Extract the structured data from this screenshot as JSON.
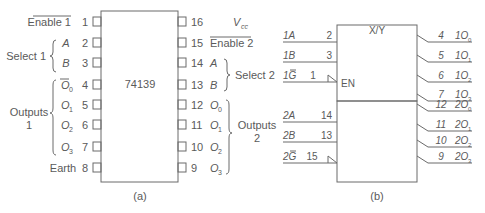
{
  "diagram_a": {
    "chip_label": "74139",
    "caption": "(a)",
    "left_pins": [
      {
        "num": "1",
        "label": "Enable 1",
        "overline": true
      },
      {
        "num": "2",
        "label": "A"
      },
      {
        "num": "3",
        "label": "B"
      },
      {
        "num": "4",
        "label": "O",
        "sub": "0"
      },
      {
        "num": "5",
        "label": "O",
        "sub": "1"
      },
      {
        "num": "6",
        "label": "O",
        "sub": "2"
      },
      {
        "num": "7",
        "label": "O",
        "sub": "3"
      },
      {
        "num": "8",
        "label": "Earth"
      }
    ],
    "right_pins": [
      {
        "num": "16",
        "label": "V",
        "sub": "cc"
      },
      {
        "num": "15",
        "label": "Enable 2",
        "overline": true
      },
      {
        "num": "14",
        "label": "A"
      },
      {
        "num": "13",
        "label": "B"
      },
      {
        "num": "12",
        "label": "O",
        "sub": "0"
      },
      {
        "num": "11",
        "label": "O",
        "sub": "1"
      },
      {
        "num": "10",
        "label": "O",
        "sub": "2"
      },
      {
        "num": "9",
        "label": "O",
        "sub": "3"
      }
    ],
    "groups": {
      "select1": "Select 1",
      "outputs1_line1": "Outputs",
      "outputs1_line2": "1",
      "select2": "Select 2",
      "outputs2_line1": "Outputs",
      "outputs2_line2": "2"
    }
  },
  "diagram_b": {
    "block_title": "X/Y",
    "enable_label": "EN",
    "caption": "(b)",
    "inputs": [
      {
        "name": "1A",
        "pin": "2"
      },
      {
        "name": "1B",
        "pin": "3"
      },
      {
        "name": "1G",
        "pin": "1",
        "overline_letter": "G"
      },
      {
        "name": "2A",
        "pin": "14"
      },
      {
        "name": "2B",
        "pin": "13"
      },
      {
        "name": "2G",
        "pin": "15",
        "overline_letter": "G"
      }
    ],
    "outputs": [
      {
        "pin": "4",
        "prefix": "1O",
        "sub": "0"
      },
      {
        "pin": "5",
        "prefix": "1O",
        "sub": "1"
      },
      {
        "pin": "6",
        "prefix": "1O",
        "sub": "2"
      },
      {
        "pin": "7",
        "prefix": "1O",
        "sub": "3"
      },
      {
        "pin": "12",
        "prefix": "2O",
        "sub": "0"
      },
      {
        "pin": "11",
        "prefix": "2O",
        "sub": "1"
      },
      {
        "pin": "10",
        "prefix": "2O",
        "sub": "2"
      },
      {
        "pin": "9",
        "prefix": "2O",
        "sub": "3"
      }
    ]
  }
}
